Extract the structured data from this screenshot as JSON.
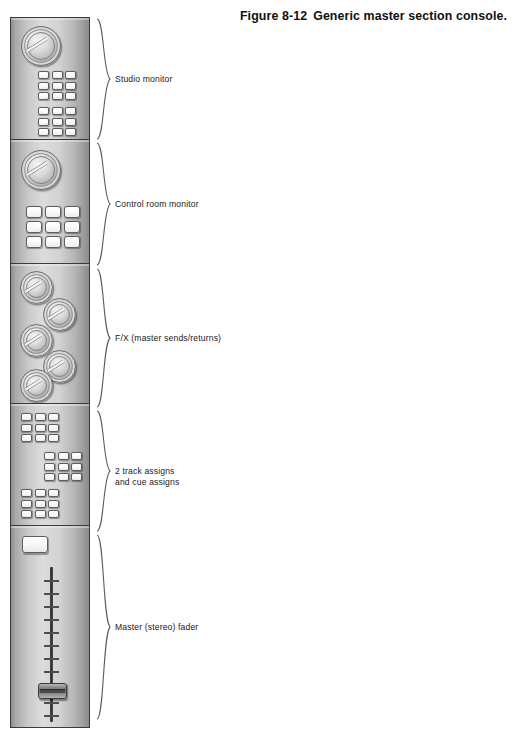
{
  "page": {
    "top_artifact_text": "",
    "background_color": "#ffffff"
  },
  "caption": {
    "number": "Figure 8-12",
    "text": "Generic master section console."
  },
  "console": {
    "title": "master section console",
    "panels": [
      {
        "id": "studio-monitor",
        "label": "Studio monitor",
        "controls": {
          "knobs": 1,
          "button_grids": [
            {
              "name": "studio-monitor-grid-upper",
              "rows": 3,
              "cols": 3,
              "size": "small"
            },
            {
              "name": "studio-monitor-grid-lower",
              "rows": 3,
              "cols": 3,
              "size": "small"
            }
          ]
        }
      },
      {
        "id": "control-room-monitor",
        "label": "Control room monitor",
        "controls": {
          "knobs": 1,
          "button_grids": [
            {
              "name": "control-room-grid",
              "rows": 3,
              "cols": 3,
              "size": "large"
            }
          ]
        }
      },
      {
        "id": "fx-sends-returns",
        "label": "F/X (master sends/returns)",
        "controls": {
          "knobs": 5,
          "button_grids": []
        }
      },
      {
        "id": "track-and-cue-assigns",
        "label": "2 track assigns\nand cue assigns",
        "controls": {
          "knobs": 0,
          "button_grids": [
            {
              "name": "assign-grid-top-left",
              "rows": 3,
              "cols": 3,
              "size": "small"
            },
            {
              "name": "assign-grid-middle-right",
              "rows": 3,
              "cols": 3,
              "size": "small"
            },
            {
              "name": "assign-grid-bottom-left",
              "rows": 3,
              "cols": 3,
              "size": "small"
            }
          ]
        }
      },
      {
        "id": "master-stereo-fader",
        "label": "Master (stereo) fader",
        "controls": {
          "knobs": 0,
          "button_grids": [],
          "mute_button": true,
          "fader": {
            "name": "master-fader",
            "ticks": 11,
            "cap_position_percent": 76
          }
        }
      }
    ]
  },
  "colors": {
    "panel_light": "#dcdcdc",
    "panel_dark": "#8a8a8a",
    "panel_border": "#3b3b3b",
    "button_face": "#ffffff",
    "brace": "#5c5c5c",
    "text": "#1a1a1a",
    "caption_text": "#111111"
  }
}
